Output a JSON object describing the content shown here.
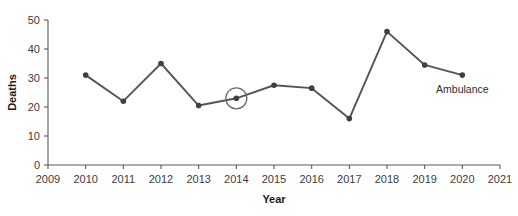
{
  "chart_data": {
    "type": "line",
    "title": "",
    "xlabel": "Year",
    "ylabel": "Deaths",
    "x": [
      2010,
      2011,
      2012,
      2013,
      2014,
      2015,
      2016,
      2017,
      2018,
      2019,
      2020
    ],
    "categories": [
      "2010",
      "2011",
      "2012",
      "2013",
      "2014",
      "2015",
      "2016",
      "2017",
      "2018",
      "2019",
      "2020"
    ],
    "series": [
      {
        "name": "Ambulance",
        "values": [
          31,
          22,
          35,
          20.5,
          23,
          27.5,
          26.5,
          16,
          46,
          34.5,
          31
        ]
      }
    ],
    "xlim": [
      2009,
      2021
    ],
    "ylim": [
      0,
      50
    ],
    "xticks": [
      2009,
      2010,
      2011,
      2012,
      2013,
      2014,
      2015,
      2016,
      2017,
      2018,
      2019,
      2020,
      2021
    ],
    "xtick_labels": [
      "2009",
      "2010",
      "2011",
      "2012",
      "2013",
      "2014",
      "2015",
      "2016",
      "2017",
      "2018",
      "2019",
      "2020",
      "2021"
    ],
    "yticks": [
      0,
      10,
      20,
      30,
      40,
      50
    ],
    "ytick_labels": [
      "0",
      "10",
      "20",
      "30",
      "40",
      "50"
    ],
    "grid": false,
    "legend": "none",
    "series_inline_label": "Ambulance",
    "annotations": [
      {
        "type": "circle",
        "target_x": 2014,
        "target_y": 23,
        "label": ""
      }
    ],
    "colors": {
      "line": "#555555",
      "marker": "#3f3f3f",
      "axis": "#5a5a5a",
      "text": "#1a1a1a",
      "annotation": "#6b6b6b",
      "background": "#ffffff"
    }
  }
}
